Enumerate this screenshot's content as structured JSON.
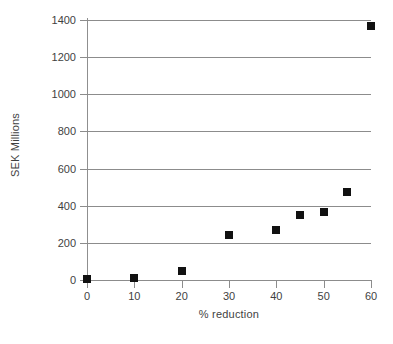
{
  "chart_data": {
    "type": "scatter",
    "title": "",
    "xlabel": "% reduction",
    "ylabel": "SEK Millions",
    "x": [
      0,
      10,
      20,
      30,
      40,
      45,
      50,
      55,
      60
    ],
    "values": [
      3,
      12,
      50,
      245,
      270,
      348,
      365,
      475,
      1370
    ],
    "series": [
      {
        "name": "SEK Millions",
        "x": [
          0,
          10,
          20,
          30,
          40,
          45,
          50,
          55,
          60
        ],
        "values": [
          3,
          12,
          50,
          245,
          270,
          348,
          365,
          475,
          1370
        ]
      }
    ],
    "xlim": [
      0,
      60
    ],
    "ylim": [
      0,
      1400
    ],
    "xticks": [
      0,
      10,
      20,
      30,
      40,
      50,
      60
    ],
    "yticks": [
      0,
      200,
      400,
      600,
      800,
      1000,
      1200,
      1400
    ],
    "xtick_labels": [
      "0",
      "10",
      "20",
      "30",
      "40",
      "50",
      "60"
    ],
    "ytick_labels": [
      "0",
      "200",
      "400",
      "600",
      "800",
      "1000",
      "1200",
      "1400"
    ],
    "grid": true,
    "grid_axis": "y",
    "legend": false,
    "marker": "square",
    "marker_color": "#111111",
    "grid_color": "#8c8c8c",
    "axis_color": "#8c8c8c",
    "text_color": "#3f3f3f",
    "background_color": "#ffffff"
  }
}
